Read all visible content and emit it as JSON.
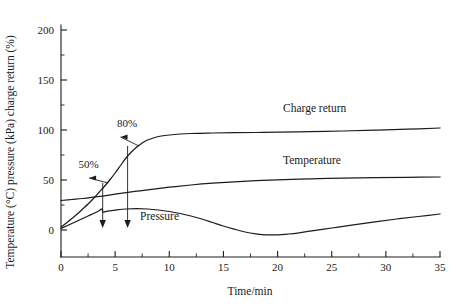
{
  "chart_data": {
    "type": "line",
    "title": "",
    "xlabel": "Time/min",
    "ylabel": "Temperature (°C) pressure (kPa) charge return (%)",
    "xlim": [
      0,
      35
    ],
    "ylim": [
      0,
      200
    ],
    "grid": false,
    "legend_position": "inline-curve-labels",
    "x_ticks": [
      "0",
      "5",
      "10",
      "15",
      "20",
      "25",
      "30",
      "35"
    ],
    "x_tick_values": [
      0,
      5,
      10,
      15,
      20,
      25,
      30,
      35
    ],
    "x_minor_step": 2.5,
    "y_ticks": [
      "0",
      "50",
      "100",
      "150",
      "200"
    ],
    "y_tick_values": [
      0,
      50,
      100,
      150,
      200
    ],
    "y_minor_step": 25,
    "series": [
      {
        "name": "Charge return",
        "label": "Charge return",
        "unit": "%",
        "label_x": 20.5,
        "label_y": 118,
        "x": [
          0,
          0.5,
          1,
          1.5,
          2,
          2.5,
          3,
          3.5,
          4,
          4.5,
          5,
          5.5,
          6,
          6.5,
          7,
          7.5,
          8,
          9,
          10,
          12,
          14,
          16,
          18,
          20,
          23,
          26,
          29,
          32,
          35
        ],
        "values": [
          3,
          7,
          11.5,
          16,
          21,
          26,
          31.5,
          37.5,
          43.5,
          50,
          57,
          64.5,
          72,
          78,
          83,
          87,
          90,
          93.5,
          95,
          96.5,
          97,
          97.3,
          97.5,
          97.8,
          98.3,
          99,
          99.8,
          100.8,
          102
        ]
      },
      {
        "name": "Temperature",
        "label": "Temperature",
        "unit": "°C",
        "label_x": 20.5,
        "label_y": 66,
        "x": [
          0,
          1,
          2,
          3,
          4,
          5,
          6,
          7,
          8,
          10,
          12,
          14,
          16,
          18,
          20,
          23,
          26,
          29,
          32,
          35
        ],
        "values": [
          29.5,
          30.5,
          31.5,
          32.8,
          34.2,
          35.8,
          37.3,
          38.8,
          40.2,
          42.8,
          45,
          46.8,
          48.2,
          49.3,
          50.2,
          51.2,
          51.9,
          52.4,
          52.7,
          53
        ]
      },
      {
        "name": "Pressure",
        "label": "Pressure",
        "unit": "kPa",
        "label_x": 7.3,
        "label_y": 10.5,
        "x": [
          0,
          0.5,
          1,
          1.5,
          2,
          2.5,
          3,
          3.4,
          3.8,
          3.85,
          4.2,
          5,
          6,
          7,
          8,
          9,
          10,
          11,
          12,
          13,
          14,
          15,
          16,
          17,
          18,
          19,
          20,
          21,
          22,
          23,
          25,
          27,
          29,
          31,
          33,
          35
        ],
        "values": [
          1.5,
          4,
          6.5,
          9,
          11.5,
          14,
          16.5,
          18.5,
          21,
          18,
          18.6,
          19.8,
          21,
          21.3,
          21,
          20,
          18.5,
          16.5,
          14,
          11,
          7.5,
          4,
          0.8,
          -2,
          -3.8,
          -4.8,
          -4.8,
          -4,
          -2.8,
          -1.2,
          2,
          5.2,
          8.2,
          11,
          13.5,
          16
        ]
      }
    ],
    "annotations": [
      {
        "name": "annotation-50-percent",
        "text": "50%",
        "label_x": 2.55,
        "label_y": 62,
        "arrow_from_x": 2.6,
        "arrow_from_y": 52,
        "arrow_to_x": 4.35,
        "arrow_to_y": 47,
        "marker_x": 3.85,
        "marker_drop_from_y": 47,
        "marker_drop_to_y": 10
      },
      {
        "name": "annotation-80-percent",
        "text": "80%",
        "label_x": 6.1,
        "label_y": 103,
        "arrow_from_x": 5.5,
        "arrow_from_y": 93,
        "arrow_to_x": 7.2,
        "arrow_to_y": 84,
        "marker_x": 6.15,
        "marker_drop_from_y": 84,
        "marker_drop_to_y": 10
      }
    ]
  }
}
